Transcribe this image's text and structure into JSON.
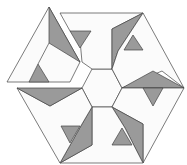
{
  "figure": {
    "title": "",
    "colors": {
      "light": "#fbfbfb",
      "dark": "#9a9a9a",
      "stroke": "#444444"
    },
    "pieces": 6,
    "detached_piece": "top-left"
  }
}
